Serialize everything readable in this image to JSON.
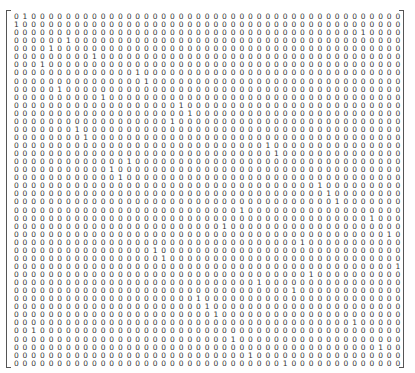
{
  "matrix": {
    "rows": 44,
    "cols": 45,
    "one_positions": [
      2,
      1,
      41,
      7,
      5,
      10,
      4,
      15,
      16,
      6,
      11,
      20,
      21,
      19,
      8,
      9,
      30,
      31,
      14,
      12,
      13,
      36,
      37,
      38,
      27,
      42,
      25,
      44,
      34,
      17,
      18,
      45,
      35,
      29,
      33,
      22,
      23,
      24,
      40,
      3,
      26,
      43,
      28,
      32
    ],
    "one_char": "1",
    "zero_char": "0"
  }
}
